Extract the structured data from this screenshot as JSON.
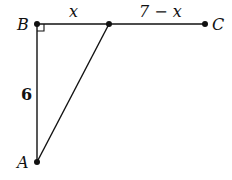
{
  "diagram": {
    "points": {
      "A": {
        "label": "A",
        "x": 37,
        "y": 162
      },
      "B": {
        "label": "B",
        "x": 37,
        "y": 24
      },
      "C": {
        "label": "C",
        "x": 205,
        "y": 24
      },
      "D": {
        "label": "",
        "x": 109,
        "y": 24
      }
    },
    "segment_labels": {
      "BD": "x",
      "DC": "7 − x",
      "AB": "6"
    },
    "right_angle_at": "B",
    "stroke_color": "#111111"
  }
}
